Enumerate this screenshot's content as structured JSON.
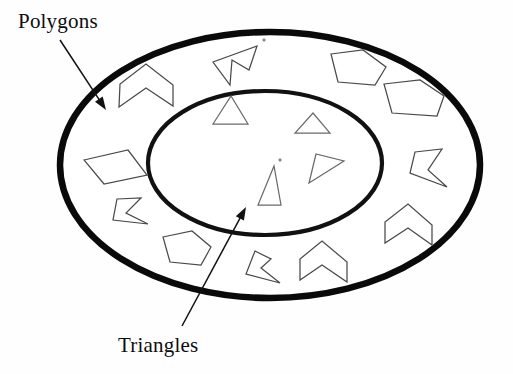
{
  "figure": {
    "background_color": "#ffffff",
    "width": 513,
    "height": 374
  },
  "labels": {
    "outer": {
      "text": "Polygons",
      "x": 18,
      "y": 28,
      "font_size": 21,
      "color": "#0d0d0d"
    },
    "inner": {
      "text": "Triangles",
      "x": 118,
      "y": 352,
      "font_size": 21,
      "color": "#0d0d0d"
    }
  },
  "leaders": {
    "polygons_arrow": {
      "name": "polygons-leader-arrow",
      "from_x": 60,
      "from_y": 40,
      "to_x": 106,
      "to_y": 110,
      "color": "#111111"
    },
    "triangles_arrow": {
      "name": "triangles-leader-arrow",
      "from_x": 182,
      "from_y": 326,
      "to_x": 246,
      "to_y": 207,
      "color": "#111111"
    }
  },
  "sets": {
    "outer_set": {
      "name": "Polygons",
      "shape": "ellipse",
      "cx": 270,
      "cy": 165,
      "rx": 210,
      "ry": 133,
      "stroke_width": 6.5,
      "stroke_color": "#0a0a0a",
      "fill_color": "#ffffff"
    },
    "inner_set": {
      "name": "Triangles",
      "shape": "ellipse",
      "cx": 265,
      "cy": 163,
      "rx": 117,
      "ry": 72,
      "stroke_width": 4.2,
      "stroke_color": "#111111",
      "fill_color": "#ffffff"
    }
  },
  "ring_shapes": [
    {
      "name": "chevron-upper-left",
      "kind": "chevron",
      "points": "119,107 120,84 146,64 173,85 173,106 146,88"
    },
    {
      "name": "parallelogram-left",
      "kind": "parallelogram",
      "points": "84,160 128,150 147,175 104,184"
    },
    {
      "name": "arrowhead-left-lower",
      "kind": "arrowhead",
      "points": "117,199 141,198 126,213 148,224 113,220"
    },
    {
      "name": "pentagon-lower-left",
      "kind": "pentagon",
      "points": "163,237 192,231 211,247 201,265 170,262"
    },
    {
      "name": "arrowhead-bottom-left",
      "kind": "arrowhead",
      "points": "255,251 271,259 261,268 280,283 246,274"
    },
    {
      "name": "chevron-bottom-center",
      "kind": "chevron",
      "points": "300,280 300,259 322,241 347,262 347,282 322,265"
    },
    {
      "name": "chevron-right-lower",
      "kind": "chevron",
      "points": "385,243 385,222 408,204 432,225 432,245 408,228"
    },
    {
      "name": "arrowhead-right",
      "kind": "arrowhead",
      "points": "415,152 442,149 428,170 447,187 410,173"
    },
    {
      "name": "pentagon-upper-right-outer",
      "kind": "pentagon",
      "points": "384,84 420,80 444,96 437,116 392,113"
    },
    {
      "name": "pentagon-upper-right-inner",
      "kind": "pentagon",
      "points": "331,54 363,50 386,67 375,85 338,82"
    },
    {
      "name": "arrowhead-top-center",
      "kind": "arrowhead",
      "points": "257,46 249,70 232,60 230,85 213,62"
    },
    {
      "name": "speck-top",
      "kind": "speck",
      "points": "264,38 266,40 264,42 262,40"
    }
  ],
  "inner_shapes": [
    {
      "name": "triangle-upper-left",
      "kind": "triangle",
      "points": "213,124 248,124 231,96"
    },
    {
      "name": "triangle-upper-right",
      "kind": "triangle",
      "points": "295,133 330,133 313,113"
    },
    {
      "name": "triangle-center-tall",
      "kind": "triangle",
      "points": "258,205 281,205 274,166"
    },
    {
      "name": "triangle-right-slanted",
      "kind": "triangle",
      "points": "309,183 344,161 316,154"
    },
    {
      "name": "speck-inner",
      "kind": "speck",
      "points": "280,158 282,160 280,162 278,160"
    }
  ],
  "colors": {
    "ink": "#0a0a0a",
    "shape_stroke": "#4a4a4a",
    "triangle_stroke": "#6a6a6a",
    "paper": "#ffffff"
  }
}
